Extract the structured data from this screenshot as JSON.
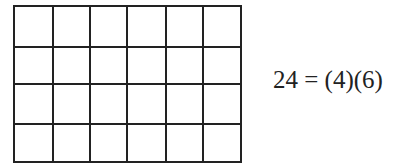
{
  "diagram": {
    "type": "rectangular-grid",
    "rows": 4,
    "columns": 6,
    "cell_count": 24,
    "line_color": "#222222",
    "x_lines": [
      14,
      53,
      90,
      127,
      166,
      203,
      241
    ],
    "y_lines": [
      6,
      47,
      84,
      124,
      162
    ]
  },
  "equation": {
    "text": "24 = (4)(6)"
  }
}
